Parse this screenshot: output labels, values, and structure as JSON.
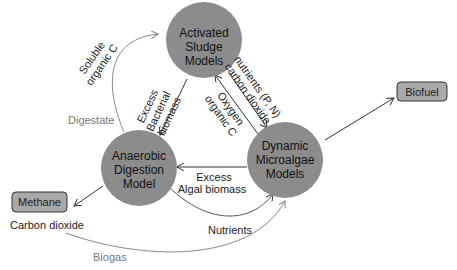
{
  "diagram": {
    "nodes": {
      "activated_sludge": {
        "lines": [
          "Activated",
          "Sludge",
          "Models"
        ]
      },
      "anaerobic_digestion": {
        "lines": [
          "Anaerobic",
          "Digestion",
          "Model"
        ]
      },
      "microalgae": {
        "lines": [
          "Dynamic",
          "Microalgae",
          "Models"
        ]
      }
    },
    "outputs": {
      "methane": "Methane",
      "biofuel": "Biofuel"
    },
    "edges": {
      "soluble_organic_c": [
        "Soluble",
        "organic C"
      ],
      "digestate": "Digestate",
      "excess_bacterial_biomass": [
        "Excess",
        "Bacterial",
        "biomass"
      ],
      "nutrients_co2": [
        "nutrients (P, N)",
        "carbon dioxide"
      ],
      "oxygen_organic_c": [
        "Oxygen",
        "organic C"
      ],
      "excess_algal_biomass": [
        "Excess",
        "Algal biomass"
      ],
      "nutrients": "Nutrients",
      "carbon_dioxide": "Carbon dioxide",
      "biogas": "Biogas"
    },
    "colors": {
      "node_fill": "#8c8c8c",
      "box_fill": "#a9a9a9",
      "arrow_dark": "#333333",
      "arrow_grey": "#8a8a8a",
      "text_grey": "#777777"
    }
  }
}
